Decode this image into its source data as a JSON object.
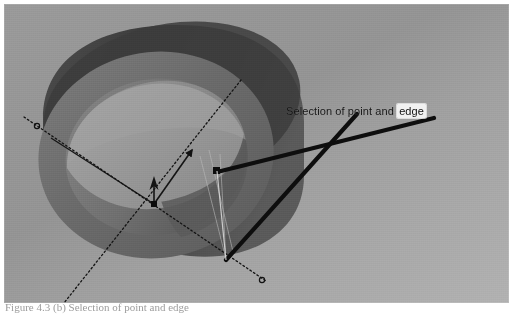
{
  "figure": {
    "kind": "cad-viewport-screenshot",
    "caption": "Figure 4.3 (b) Selection of point and edge",
    "annotation": {
      "prefix_text": "Selection of point and",
      "selected_token": "edge",
      "full_text": "Selection of point and edge",
      "selected_token_highlight_color": "#f2f2f2",
      "text_color": "#1b1b1b"
    },
    "model": {
      "name": "hollow-cylinder",
      "description": "Hollow cylindrical tube shown in isometric view",
      "body_color": "#3d3d3d",
      "front_ring_color": "#6e6e6e",
      "inner_face_color": "#969696",
      "inner_bore_color": "#828282",
      "highlight_color": "#b0b0b0"
    },
    "viewport": {
      "background_top_color": "#9a9a9a",
      "background_bottom_color": "#b2b2b2"
    },
    "axes": {
      "line_style": "dotted",
      "color": "#1a1a1a",
      "origin_marker": "point-marker",
      "endpoint_markers": 2,
      "labels": []
    },
    "leaders": [
      {
        "name": "leader-to-point",
        "color": "#111111",
        "target": "point"
      },
      {
        "name": "leader-to-edge",
        "color": "#111111",
        "target": "edge"
      }
    ]
  }
}
